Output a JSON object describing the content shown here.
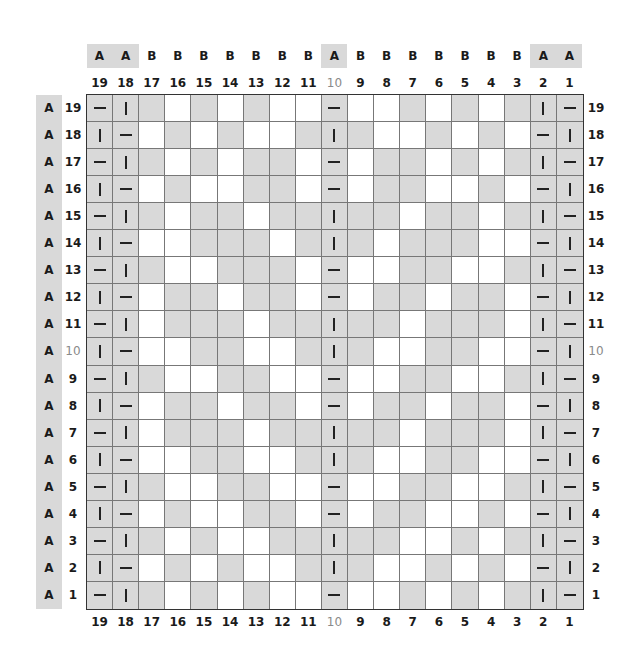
{
  "chart_data": {
    "type": "table",
    "title": "",
    "columns": [
      19,
      18,
      17,
      16,
      15,
      14,
      13,
      12,
      11,
      10,
      9,
      8,
      7,
      6,
      5,
      4,
      3,
      2,
      1
    ],
    "column_groups": [
      "A",
      "A",
      "B",
      "B",
      "B",
      "B",
      "B",
      "B",
      "B",
      "A",
      "B",
      "B",
      "B",
      "B",
      "B",
      "B",
      "B",
      "A",
      "A"
    ],
    "rows": [
      19,
      18,
      17,
      16,
      15,
      14,
      13,
      12,
      11,
      10,
      9,
      8,
      7,
      6,
      5,
      4,
      3,
      2,
      1
    ],
    "row_groups": [
      "A",
      "A",
      "A",
      "A",
      "A",
      "A",
      "A",
      "A",
      "A",
      "A",
      "A",
      "A",
      "A",
      "A",
      "A",
      "A",
      "A",
      "A",
      "A"
    ],
    "highlighted_number": 10,
    "cells": [
      [
        "-",
        "|",
        "G",
        "W",
        "G",
        "W",
        "G",
        "W",
        "W",
        "-",
        "W",
        "W",
        "G",
        "W",
        "G",
        "W",
        "G",
        "|",
        "-"
      ],
      [
        "|",
        "-",
        "W",
        "G",
        "W",
        "G",
        "W",
        "W",
        "G",
        "|",
        "G",
        "W",
        "W",
        "G",
        "W",
        "G",
        "W",
        "-",
        "|"
      ],
      [
        "-",
        "|",
        "G",
        "W",
        "G",
        "W",
        "G",
        "G",
        "W",
        "-",
        "W",
        "G",
        "G",
        "W",
        "G",
        "W",
        "G",
        "|",
        "-"
      ],
      [
        "|",
        "-",
        "W",
        "G",
        "W",
        "W",
        "G",
        "G",
        "W",
        "-",
        "W",
        "G",
        "G",
        "W",
        "W",
        "G",
        "W",
        "-",
        "|"
      ],
      [
        "-",
        "|",
        "G",
        "W",
        "G",
        "G",
        "W",
        "G",
        "G",
        "|",
        "G",
        "G",
        "W",
        "G",
        "G",
        "W",
        "G",
        "|",
        "-"
      ],
      [
        "|",
        "-",
        "W",
        "W",
        "G",
        "G",
        "G",
        "W",
        "G",
        "|",
        "G",
        "W",
        "G",
        "G",
        "G",
        "W",
        "W",
        "-",
        "|"
      ],
      [
        "-",
        "|",
        "G",
        "W",
        "W",
        "G",
        "G",
        "G",
        "W",
        "-",
        "W",
        "W",
        "G",
        "G",
        "W",
        "W",
        "G",
        "|",
        "-"
      ],
      [
        "|",
        "-",
        "W",
        "G",
        "G",
        "W",
        "G",
        "G",
        "W",
        "-",
        "W",
        "G",
        "G",
        "W",
        "G",
        "G",
        "W",
        "-",
        "|"
      ],
      [
        "-",
        "|",
        "W",
        "G",
        "G",
        "G",
        "W",
        "G",
        "G",
        "|",
        "G",
        "G",
        "W",
        "G",
        "G",
        "G",
        "W",
        "|",
        "-"
      ],
      [
        "|",
        "-",
        "W",
        "W",
        "G",
        "G",
        "W",
        "W",
        "G",
        "|",
        "G",
        "W",
        "W",
        "G",
        "G",
        "W",
        "W",
        "-",
        "|"
      ],
      [
        "-",
        "|",
        "G",
        "W",
        "W",
        "G",
        "G",
        "W",
        "W",
        "-",
        "W",
        "W",
        "G",
        "G",
        "W",
        "W",
        "G",
        "|",
        "-"
      ],
      [
        "|",
        "-",
        "W",
        "G",
        "G",
        "W",
        "G",
        "G",
        "W",
        "-",
        "W",
        "G",
        "G",
        "W",
        "G",
        "G",
        "W",
        "-",
        "|"
      ],
      [
        "-",
        "|",
        "W",
        "G",
        "G",
        "G",
        "W",
        "G",
        "G",
        "|",
        "G",
        "G",
        "W",
        "G",
        "G",
        "G",
        "W",
        "|",
        "-"
      ],
      [
        "|",
        "-",
        "W",
        "W",
        "G",
        "G",
        "W",
        "W",
        "G",
        "|",
        "G",
        "W",
        "W",
        "G",
        "G",
        "W",
        "W",
        "-",
        "|"
      ],
      [
        "-",
        "|",
        "G",
        "W",
        "W",
        "G",
        "G",
        "W",
        "W",
        "-",
        "W",
        "W",
        "G",
        "G",
        "W",
        "W",
        "G",
        "|",
        "-"
      ],
      [
        "|",
        "-",
        "W",
        "G",
        "W",
        "W",
        "G",
        "G",
        "W",
        "-",
        "W",
        "G",
        "G",
        "W",
        "W",
        "G",
        "W",
        "-",
        "|"
      ],
      [
        "-",
        "|",
        "G",
        "W",
        "G",
        "W",
        "W",
        "G",
        "G",
        "|",
        "G",
        "G",
        "W",
        "W",
        "G",
        "W",
        "G",
        "|",
        "-"
      ],
      [
        "|",
        "-",
        "W",
        "G",
        "W",
        "G",
        "W",
        "W",
        "G",
        "|",
        "G",
        "W",
        "W",
        "G",
        "W",
        "G",
        "W",
        "-",
        "|"
      ],
      [
        "-",
        "|",
        "G",
        "W",
        "G",
        "W",
        "G",
        "W",
        "W",
        "-",
        "W",
        "W",
        "G",
        "W",
        "G",
        "W",
        "G",
        "|",
        "-"
      ]
    ]
  },
  "colors": {
    "fill_gray": "#d9d9d9",
    "fill_white": "#ffffff",
    "grid_line": "#777777",
    "outline": "#333333",
    "dim_label": "#8a8a8a"
  }
}
